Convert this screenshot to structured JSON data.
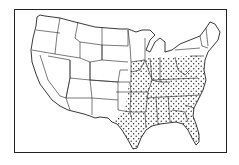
{
  "map": {
    "subject": "Map of the contiguous United States with state boundaries",
    "highlighted_region": "Southeastern and south-central states shown with stippled (dotted) fill",
    "colors": {
      "line": "#222222",
      "background": "#ffffff",
      "stipple": "#222222"
    }
  }
}
